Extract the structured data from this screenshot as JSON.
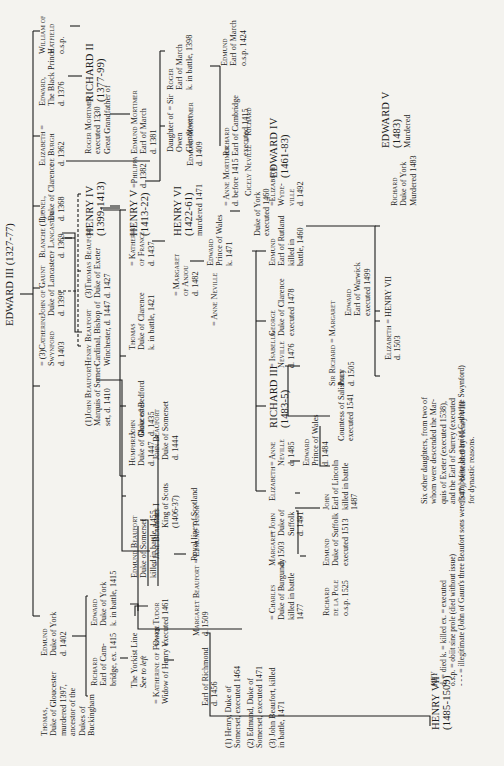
{
  "title": "EDWARD III (1327-77)",
  "nodes": {
    "edward_black_prince": [
      "Edward,",
      "The Black Prince",
      "d. 1376"
    ],
    "richard_ii": [
      "RICHARD II",
      "(1377-99)"
    ],
    "william_hatfield": [
      "William of",
      "Hatfield",
      "o.s.p."
    ],
    "elizabeth_burgh": [
      "Elizabeth =",
      "de Burgh",
      "d. 1362"
    ],
    "lionel": [
      "Lionel,",
      "Duke of Clarence",
      "d. 1368"
    ],
    "blanche": [
      "Blanche (1) =",
      "of Lancaster",
      "d. 1369"
    ],
    "john_gaunt": [
      "John of Gaunt",
      "Duke of Lancaster",
      "d. 1399"
    ],
    "catherine_swynford": [
      "= (3)Catherine",
      "Swynford",
      "d. 1403"
    ],
    "edmund_york": [
      "Edmund",
      "Duke of York",
      "d. 1402"
    ],
    "thomas_gloucester": [
      "Thomas,",
      "Duke of Gloucester",
      "murdered 1397,",
      "ancestor of the",
      "Dukes of",
      "Buckingham"
    ],
    "roger_mortimer_1330": [
      "Roger Mortimer",
      "executed 1330",
      "Great Grandfather of"
    ],
    "edmund_mortimer_1381": [
      "Edmund Mortimer",
      "Earl of March",
      "d. 1381"
    ],
    "philippa": [
      "=Philippa",
      "d. 1382"
    ],
    "henry_iv": [
      "HENRY IV",
      "(1399-1413)"
    ],
    "thomas_beaufort": [
      "(3)Thomas Beaufort",
      "Duke of Exeter",
      "d. 1427"
    ],
    "henry_beaufort": [
      "Henry Beaufort",
      "Cardinal, Bishop of",
      "Winchester, d. 1447"
    ],
    "john_beaufort_1410": [
      "(1)John Beaufort",
      "Marquis of Somer-",
      "set, d. 1410"
    ],
    "edward_york_1415": [
      "Edward",
      "Duke of York",
      "k. in battle, 1415"
    ],
    "richard_cambridge_top": [
      "Richard",
      "Earl of Cam-",
      "bridge, ex. 1415"
    ],
    "yorkist_line": [
      "The Yorkist Line",
      "See to left"
    ],
    "roger_march": [
      "Roger",
      "Earl of March",
      "k. in battle, 1398"
    ],
    "daughter_glendower": [
      "Daughter of  = Sir",
      "Owen",
      "Glendower"
    ],
    "sir_edmund_mortimer": [
      "Edmund Mortimer",
      "d. 1409"
    ],
    "henry_v": [
      "HENRY V",
      "(1413-22)"
    ],
    "katherine_france_1437": [
      "= Katherine",
      "of France",
      "d. 1437"
    ],
    "thomas_clarence": [
      "Thomas",
      "Duke of Clarence",
      "k. in battle, 1421"
    ],
    "john_bedford": [
      "John",
      "Duke of Bedford",
      "d. 1435"
    ],
    "humphrey": [
      "Humphrey",
      "Duke of Gloucester",
      "d. 1447"
    ],
    "john_beaufort_1444": [
      "John Beaufort",
      "Duke of Somerset",
      "d. 1444"
    ],
    "james_i": [
      "James I",
      "King of Scots",
      "(1406-37)"
    ],
    "jane_beaufort": [
      "= Jane Beaufort"
    ],
    "royal_scotland": [
      "Royal line of Scotland"
    ],
    "edmund_beaufort": [
      "Edmund Beaufort",
      "Duke of Somerset",
      "killed in battle, 1455"
    ],
    "owen_tudor": [
      "Owen Tudor",
      "executed 1461"
    ],
    "katherine_widow": [
      "= Katherine of France",
      "Widow of Henry V"
    ],
    "margaret_beaufort": [
      "Margaret Beaufort = Edmund Tudor",
      "d. 1509"
    ],
    "edmund_tudor": [
      "Earl of Richmond",
      "d. 1456"
    ],
    "somerset_sons": [
      "(1) Henry, Duke of",
      "Somerset, executed 1464",
      "(2) Edmund, Duke of",
      "Somerset, executed 1471",
      "(3) John Beaufort, killed",
      "in battle, 1471"
    ],
    "henry_vii_top": [
      "HENRY VII",
      "(1485-1509)"
    ],
    "edmund_march_1424": [
      "Edmund",
      "Earl of March",
      "o.s.p. 1424"
    ],
    "richard_cambridge": [
      "Richard",
      "Earl of Cambridge",
      "executed 1415"
    ],
    "anne_mortimer": [
      "= Anne Mortimer",
      "d. before 1415"
    ],
    "cicely_neville": [
      "Cicely Neville = Richard"
    ],
    "richard_york_1460": [
      "Duke of York",
      "executed 1460"
    ],
    "henry_vi": [
      "HENRY VI",
      "(1422-61)",
      "murdered 1471"
    ],
    "margaret_anjou": [
      "= Margaret",
      "of Anjou",
      "d. 1482"
    ],
    "edward_wales_1471": [
      "Edward",
      "Prince of Wales",
      "k. 1471"
    ],
    "anne_neville_first": [
      "= Anne Neville"
    ],
    "edward_iv": [
      "EDWARD IV",
      "(1461-83)"
    ],
    "elizabeth_woodville": [
      "=Elizabeth",
      "Wyde-",
      "ville",
      "d. 1492"
    ],
    "edmund_rutland": [
      "Edmund",
      "Earl of Rutland",
      "killed in",
      "battle, 1460"
    ],
    "george_clarence": [
      "George",
      "Duke of Clarence",
      "executed 1478"
    ],
    "isabella_neville": [
      "= Isabella",
      "Neville",
      "d. 1476"
    ],
    "richard_iii": [
      "RICHARD III",
      "(1483-5)"
    ],
    "anne_neville_1485": [
      "= Anne",
      "Neville",
      "d. 1485"
    ],
    "edward_wales_1484": [
      "Edward",
      "Prince of Wales",
      "d. 1484"
    ],
    "elizabeth_suffolk": [
      "Elizabeth"
    ],
    "john_suffolk": [
      "= John",
      "Duke of",
      "Suffolk",
      "d. 1491"
    ],
    "margaret_burgundy": [
      "Margaret",
      "d. 1503"
    ],
    "charles_burgundy": [
      "= Charles",
      "Duke of Burgundy",
      "killed in battle",
      "1477"
    ],
    "john_lincoln": [
      "John",
      "Earl of Lincoln",
      "killed in battle",
      "1487"
    ],
    "edmund_suffolk": [
      "Edmund",
      "Duke of Suffolk",
      "executed 1513"
    ],
    "richard_de_la_pole": [
      "Richard",
      "de la Pole",
      "o.s.p. 1525"
    ],
    "edward_warwick": [
      "Edward",
      "Earl of Warwick",
      "executed 1499"
    ],
    "sir_richard_pole": [
      "Sir Richard = Margaret",
      "Pole",
      "d. 1505"
    ],
    "margaret_salisbury": [
      "Countess of Salisbury",
      "executed 1541"
    ],
    "edward_v": [
      "EDWARD V",
      "(1483)",
      "Murdered"
    ],
    "richard_york_1483": [
      "Richard",
      "Duke of York",
      "Murdered 1483"
    ],
    "elizabeth_henry_vii": [
      "Elizabeth = HENRY VII",
      "d. 1503"
    ],
    "six_daughters": [
      "Six other daughters, from two of",
      "whom were descended the Mar-",
      "quis of Exeter (executed 1538),",
      "and the Earl of Surrey (executed",
      "1547), beheaded by Henry VIII",
      "for dynastic reasons."
    ]
  },
  "key": {
    "title": "KEY",
    "lines": [
      "d. = died          k. = killed          ex. = executed",
      "o.s.p. = obiit sine prole (died without issue)",
      "- - - = illegitimate (John of Gaunt's three Beaufort sons were born before he married Catherine Swynford)"
    ]
  }
}
